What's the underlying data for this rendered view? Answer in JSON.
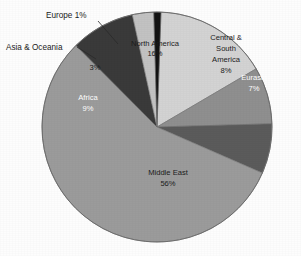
{
  "chart_data": {
    "type": "pie",
    "title": "",
    "subtitle": "",
    "xlabel": "",
    "ylabel": "",
    "legend_position": "none",
    "grid": false,
    "units": "percent",
    "total": 100,
    "categories": [
      "North America",
      "Central & South America",
      "Eurasia",
      "Middle East",
      "Africa",
      "Asia & Oceania",
      "Europe"
    ],
    "values": [
      16,
      8,
      7,
      56,
      9,
      3,
      1
    ],
    "slices": [
      {
        "name": "North America",
        "value": 16,
        "value_label": "16%",
        "label_line1": "North America",
        "label_line2": "16%",
        "color": "#d3d3d3",
        "label_placement": "inside",
        "label_color": "dark",
        "start_angle": -88,
        "end_angle": -30.4,
        "label_x": 155,
        "label_y": 46,
        "label_x2": 155,
        "label_y2": 56
      },
      {
        "name": "Central & South America",
        "value": 8,
        "value_label": "8%",
        "label_line1": "Central &",
        "label_line2": "South",
        "label_line3": "America",
        "label_line4": "8%",
        "color": "#8f8f8f",
        "label_placement": "inside",
        "label_color": "dark",
        "start_angle": -30.4,
        "end_angle": -1.6,
        "label_x": 226,
        "label_y": 40,
        "label_x2": 226,
        "label_y2": 51,
        "label_x3": 226,
        "label_y3": 62,
        "label_x4": 226,
        "label_y4": 73
      },
      {
        "name": "Eurasia",
        "value": 7,
        "value_label": "7%",
        "label_line1": "Eurasia",
        "label_line2": "7%",
        "color": "#5b5b5b",
        "label_placement": "inside",
        "label_color": "light",
        "start_angle": -1.6,
        "end_angle": 23.6,
        "label_x": 254,
        "label_y": 80,
        "label_x2": 254,
        "label_y2": 91
      },
      {
        "name": "Middle East",
        "value": 56,
        "value_label": "56%",
        "label_line1": "Middle East",
        "label_line2": "56%",
        "color": "#9b9b9b",
        "label_placement": "inside",
        "label_color": "dark",
        "start_angle": 23.6,
        "end_angle": 225.2,
        "label_x": 168,
        "label_y": 175,
        "label_x2": 168,
        "label_y2": 186
      },
      {
        "name": "Africa",
        "value": 9,
        "value_label": "9%",
        "label_line1": "Africa",
        "label_line2": "9%",
        "color": "#3a3a3a",
        "label_placement": "inside",
        "label_color": "light",
        "start_angle": 225.2,
        "end_angle": 257.6,
        "label_x": 88,
        "label_y": 100,
        "label_x2": 88,
        "label_y2": 111
      },
      {
        "name": "Asia & Oceania",
        "value": 3,
        "value_label": "3%",
        "label_line1": "3%",
        "color": "#c2c2c2",
        "label_placement": "inside-value-only",
        "label_color": "dark",
        "start_angle": 257.6,
        "end_angle": 268.4,
        "label_x": 95,
        "label_y": 70
      },
      {
        "name": "Europe",
        "value": 1,
        "value_label": "1%",
        "color": "#121212",
        "label_placement": "callout",
        "label_color": "dark",
        "start_angle": 268.4,
        "end_angle": 272.0
      }
    ],
    "callouts": [
      {
        "name": "europe-callout",
        "text": "Europe 1%",
        "text_x": 46,
        "text_y": 18,
        "line_x1": 98,
        "line_y1": 21,
        "line_x2": 118,
        "line_y2": 44
      },
      {
        "name": "asia-oceania-callout",
        "text": "Asia & Oceania",
        "text_x": 6,
        "text_y": 50,
        "line_x1": 77,
        "line_y1": 47,
        "line_x2": 96,
        "line_y2": 59
      }
    ],
    "annotations": []
  },
  "chart": {
    "center_x": 157,
    "center_y": 127,
    "radius": 115,
    "outline_color": "#5a5a5a",
    "background": "#ffffff"
  }
}
